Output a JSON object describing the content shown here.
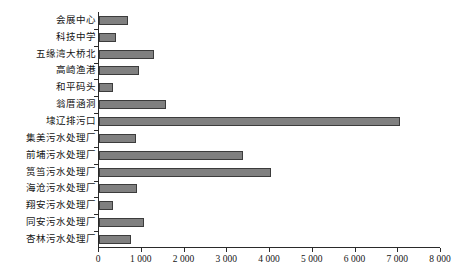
{
  "chart_data": {
    "type": "bar",
    "orientation": "horizontal",
    "title": "",
    "subtitle": "",
    "xlabel": "",
    "ylabel": "",
    "xlim": [
      0,
      8000
    ],
    "ylim": null,
    "grid": false,
    "legend": null,
    "legend_position": "none",
    "bar_color": "#808080",
    "bar_border_color": "#3c3c3c",
    "axis_color": "#2a2a2a",
    "xticks": [
      0,
      1000,
      2000,
      3000,
      4000,
      5000,
      6000,
      7000,
      8000
    ],
    "xtick_labels": [
      "0",
      "1 000",
      "2 000",
      "3 000",
      "4 000",
      "5 000",
      "6 000",
      "7 000",
      "8 000"
    ],
    "categories": [
      "会展中心",
      "科技中学",
      "五缘湾大桥北",
      "高崎渔港",
      "和平码头",
      "翁厝涵洞",
      "埭辽排污口",
      "集美污水处理厂",
      "前埔污水处理厂",
      "筼筜污水处理厂",
      "海沧污水处理厂",
      "翔安污水处理厂",
      "同安污水处理厂",
      "杏林污水处理厂"
    ],
    "values": [
      680,
      400,
      1290,
      940,
      330,
      1570,
      7050,
      870,
      3360,
      4020,
      880,
      330,
      1060,
      760
    ],
    "series": [
      {
        "name": "",
        "values": [
          680,
          400,
          1290,
          940,
          330,
          1570,
          7050,
          870,
          3360,
          4020,
          880,
          330,
          1060,
          760
        ]
      }
    ]
  }
}
